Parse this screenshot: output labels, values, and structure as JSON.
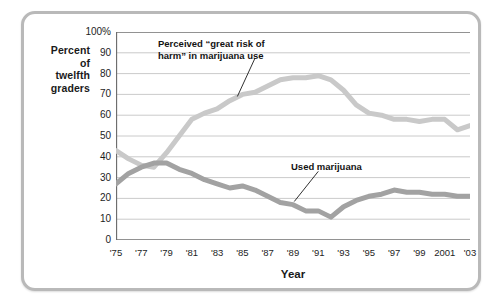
{
  "figure": {
    "frame_color": "#b9b9b9",
    "background": "#ffffff"
  },
  "axis": {
    "y_label_line1": "Percent",
    "y_label_line2": "of",
    "y_label_line3": "twelfth",
    "y_label_line4": "graders",
    "x_label": "Year"
  },
  "annotations": {
    "risk_line1": "Perceived “great risk of",
    "risk_line2": "harm” in marijuana use",
    "use": "Used marijuana"
  },
  "chart_data": {
    "type": "line",
    "title": "",
    "xlabel": "Year",
    "ylabel": "Percent of twelfth graders",
    "xlim": [
      1975,
      2003
    ],
    "ylim": [
      0,
      100
    ],
    "grid": true,
    "legend_position": "inline-annotations",
    "ytick_labels": [
      "0",
      "10",
      "20",
      "30",
      "40",
      "50",
      "60",
      "70",
      "80",
      "90",
      "100%"
    ],
    "ytick_values": [
      0,
      10,
      20,
      30,
      40,
      50,
      60,
      70,
      80,
      90,
      100
    ],
    "xtick_labels": [
      "'75",
      "'77",
      "'79",
      "'81",
      "'83",
      "'85",
      "'87",
      "'89",
      "'91",
      "'93",
      "'95",
      "'97",
      "'99",
      "2001",
      "'03"
    ],
    "xtick_values": [
      1975,
      1977,
      1979,
      1981,
      1983,
      1985,
      1987,
      1989,
      1991,
      1993,
      1995,
      1997,
      1999,
      2001,
      2003
    ],
    "x": [
      1975,
      1976,
      1977,
      1978,
      1979,
      1980,
      1981,
      1982,
      1983,
      1984,
      1985,
      1986,
      1987,
      1988,
      1989,
      1990,
      1991,
      1992,
      1993,
      1994,
      1995,
      1996,
      1997,
      1998,
      1999,
      2000,
      2001,
      2002,
      2003
    ],
    "series": [
      {
        "name": "Perceived “great risk of harm” in marijuana use",
        "color": "#c9c9c9",
        "linewidth": 5,
        "values": [
          43,
          39,
          36,
          35,
          42,
          50,
          58,
          61,
          63,
          67,
          70,
          71,
          74,
          77,
          78,
          78,
          79,
          77,
          72,
          65,
          61,
          60,
          58,
          58,
          57,
          58,
          58,
          53,
          55
        ]
      },
      {
        "name": "Used marijuana",
        "color": "#a2a2a2",
        "linewidth": 5,
        "values": [
          27,
          32,
          35,
          37,
          37,
          34,
          32,
          29,
          27,
          25,
          26,
          24,
          21,
          18,
          17,
          14,
          14,
          11,
          16,
          19,
          21,
          22,
          24,
          23,
          23,
          22,
          22,
          21,
          21
        ]
      }
    ]
  }
}
